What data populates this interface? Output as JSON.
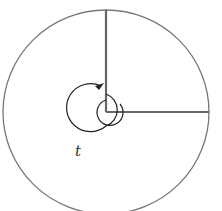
{
  "diagram": {
    "label_t": "t",
    "colors": {
      "circle": "#777777",
      "rays": "#666666",
      "spiral": "#222222",
      "background": "#ffffff"
    }
  }
}
